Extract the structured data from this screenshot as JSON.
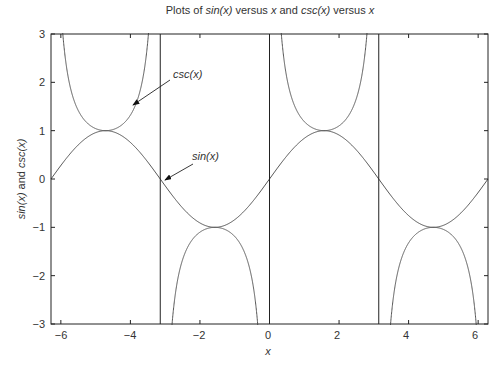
{
  "title": {
    "parts": [
      "Plots of ",
      "sin(x)",
      " versus ",
      "x",
      " and ",
      "csc(x)",
      " versus ",
      "x"
    ]
  },
  "axes": {
    "xlabel": "x",
    "ylabel_parts": [
      "sin(x)",
      " and ",
      "csc(x)"
    ],
    "xticks": [
      "−6",
      "−4",
      "−2",
      "0",
      "2",
      "4",
      "6"
    ],
    "yticks": [
      "3",
      "2",
      "1",
      "0",
      "−1",
      "−2",
      "−3"
    ]
  },
  "annotations": {
    "csc_label": "csc(x)",
    "sin_label": "sin(x)"
  },
  "colors": {
    "curve": "#555555",
    "axis": "#222222"
  },
  "chart_data": {
    "type": "line",
    "title": "Plots of sin(x) versus x and csc(x) versus x",
    "xlabel": "x",
    "ylabel": "sin(x) and csc(x)",
    "xlim": [
      -6.2832,
      6.2832
    ],
    "ylim": [
      -3,
      3
    ],
    "xticks": [
      -6,
      -4,
      -2,
      0,
      2,
      4,
      6
    ],
    "yticks": [
      -3,
      -2,
      -1,
      0,
      1,
      2,
      3
    ],
    "grid": false,
    "legend": "none (inline annotations with arrows)",
    "series": [
      {
        "name": "sin(x)",
        "function": "sin(x)",
        "x_range": [
          -6.2832,
          6.2832
        ],
        "key_points": [
          [
            -6.2832,
            0
          ],
          [
            -4.7124,
            1
          ],
          [
            -3.1416,
            0
          ],
          [
            -1.5708,
            -1
          ],
          [
            0,
            0
          ],
          [
            1.5708,
            1
          ],
          [
            3.1416,
            0
          ],
          [
            4.7124,
            -1
          ],
          [
            6.2832,
            0
          ]
        ]
      },
      {
        "name": "csc(x)",
        "function": "1/sin(x)",
        "x_range": [
          -6.2832,
          6.2832
        ],
        "key_points": [
          [
            -4.7124,
            1
          ],
          [
            -1.5708,
            -1
          ],
          [
            1.5708,
            1
          ],
          [
            4.7124,
            -1
          ]
        ],
        "vertical_asymptotes": [
          -3.1416,
          0,
          3.1416
        ]
      }
    ],
    "annotations": [
      {
        "text": "csc(x)",
        "arrow_to": [
          -3.9,
          1.45
        ]
      },
      {
        "text": "sin(x)",
        "arrow_to": [
          -3.0,
          0.05
        ]
      }
    ]
  }
}
